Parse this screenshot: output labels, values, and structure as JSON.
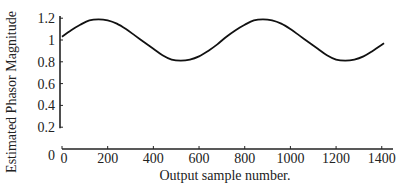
{
  "chart_data": {
    "type": "line",
    "title": "",
    "xlabel": "Output sample number.",
    "ylabel": "Estimated Phasor Magnitude",
    "xlim": [
      0,
      1410
    ],
    "ylim": [
      0,
      1.2
    ],
    "xticks": [
      0,
      200,
      400,
      600,
      800,
      1000,
      1200,
      1400
    ],
    "xtick_labels": [
      "0",
      "200",
      "400",
      "600",
      "800",
      "1000",
      "1200",
      "1400"
    ],
    "yticks": [
      0,
      0.2,
      0.4,
      0.6,
      0.8,
      1,
      1.2
    ],
    "ytick_labels": [
      "0",
      "0.2",
      "0.4",
      "0.6",
      "0.8",
      "1",
      "1.2"
    ],
    "grid": false,
    "legend": null,
    "series": [
      {
        "name": "Estimated Phasor Magnitude",
        "color": "#111111",
        "x": [
          0,
          40,
          80,
          120,
          160,
          200,
          240,
          280,
          320,
          360,
          400,
          440,
          480,
          520,
          560,
          600,
          640,
          680,
          720,
          760,
          800,
          840,
          880,
          920,
          960,
          1000,
          1040,
          1080,
          1120,
          1160,
          1200,
          1240,
          1280,
          1320,
          1360,
          1410
        ],
        "y": [
          1.03,
          1.09,
          1.14,
          1.18,
          1.19,
          1.18,
          1.15,
          1.1,
          1.04,
          0.98,
          0.92,
          0.86,
          0.82,
          0.81,
          0.82,
          0.85,
          0.9,
          0.96,
          1.03,
          1.09,
          1.14,
          1.18,
          1.19,
          1.18,
          1.15,
          1.1,
          1.04,
          0.98,
          0.92,
          0.86,
          0.82,
          0.81,
          0.82,
          0.85,
          0.9,
          0.97
        ]
      }
    ]
  },
  "layout": {
    "plot_left": 62,
    "plot_right": 393,
    "x_px_per_unit": 0.2284,
    "y_zero_px": 149,
    "y_px_per_unit": 109
  }
}
